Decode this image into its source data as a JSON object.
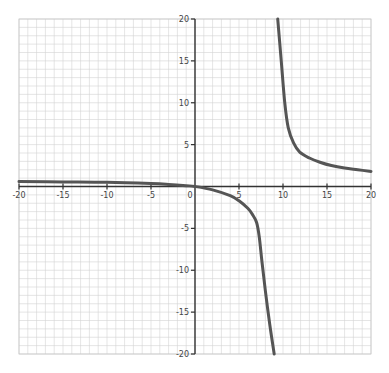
{
  "chart_data": {
    "type": "line",
    "title": "",
    "xlabel": "",
    "ylabel": "",
    "xlim": [
      -20,
      20
    ],
    "ylim": [
      -20,
      20
    ],
    "grid": true,
    "grid_step": 1,
    "x_ticks": [
      -20,
      -15,
      -10,
      -5,
      0,
      5,
      10,
      15,
      20
    ],
    "y_ticks": [
      -20,
      -15,
      -10,
      -5,
      0,
      5,
      10,
      15,
      20
    ],
    "x_tick_labels": [
      "-20",
      "-15",
      "-10",
      "-5",
      "0",
      "5",
      "10",
      "15",
      "20"
    ],
    "y_tick_labels": [
      "-20",
      "-15",
      "-10",
      "-5",
      "0",
      "5",
      "10",
      "15",
      "20"
    ],
    "vertical_asymptote_approx": 9.2,
    "series": [
      {
        "name": "left-branch",
        "color": "#555555",
        "points": [
          [
            -20,
            0.6
          ],
          [
            -15,
            0.55
          ],
          [
            -10,
            0.5
          ],
          [
            -5,
            0.35
          ],
          [
            -3,
            0.25
          ],
          [
            -1,
            0.1
          ],
          [
            0,
            0
          ],
          [
            2,
            -0.4
          ],
          [
            4,
            -1.1
          ],
          [
            5,
            -1.7
          ],
          [
            6,
            -2.6
          ],
          [
            6.5,
            -3.3
          ],
          [
            7,
            -4.3
          ],
          [
            7.3,
            -6
          ],
          [
            7.6,
            -8.9
          ],
          [
            8,
            -12.5
          ],
          [
            8.5,
            -16.5
          ],
          [
            9.0,
            -20
          ]
        ]
      },
      {
        "name": "right-branch",
        "color": "#555555",
        "points": [
          [
            9.4,
            20
          ],
          [
            9.8,
            15
          ],
          [
            10.2,
            10
          ],
          [
            10.6,
            7
          ],
          [
            11.2,
            5.2
          ],
          [
            11.9,
            4.1
          ],
          [
            13,
            3.4
          ],
          [
            14.2,
            2.9
          ],
          [
            15.5,
            2.5
          ],
          [
            17,
            2.2
          ],
          [
            18.5,
            2.0
          ],
          [
            20,
            1.8
          ]
        ]
      }
    ]
  },
  "header": {
    "partial_text": "…g     …g"
  }
}
